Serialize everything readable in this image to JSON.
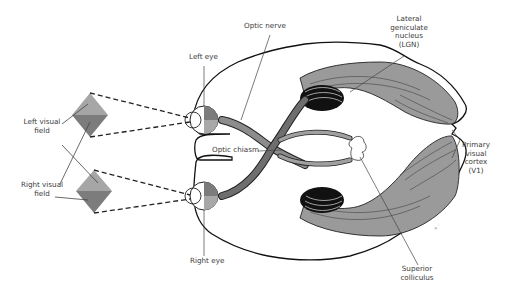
{
  "diagram": {
    "labels": {
      "optic_nerve": "Optic nerve",
      "lgn_line1": "Lateral",
      "lgn_line2": "geniculate",
      "lgn_line3": "nucleus",
      "lgn_line4": "(LGN)",
      "left_eye": "Left eye",
      "left_visual_field_line1": "Left visual",
      "left_visual_field_line2": "field",
      "optic_chiasm": "Optic chiasm",
      "primary_visual_cortex_line1": "Primary",
      "primary_visual_cortex_line2": "visual",
      "primary_visual_cortex_line3": "cortex",
      "primary_visual_cortex_line4": "(V1)",
      "right_visual_field_line1": "Right visual",
      "right_visual_field_line2": "field",
      "right_eye": "Right eye",
      "superior_colliculus_line1": "Superior",
      "superior_colliculus_line2": "colliculus",
      "signature": "© ..."
    },
    "colors": {
      "outline": "#1a1a1a",
      "pathway_gray": "#9a9a9a",
      "pathway_dark": "#6e6e6e",
      "lgn_black": "#111111",
      "field_light": "#a8a8a8",
      "field_dark": "#7d7d7d",
      "colliculus": "#ffffff",
      "leader_line": "#555555"
    }
  }
}
